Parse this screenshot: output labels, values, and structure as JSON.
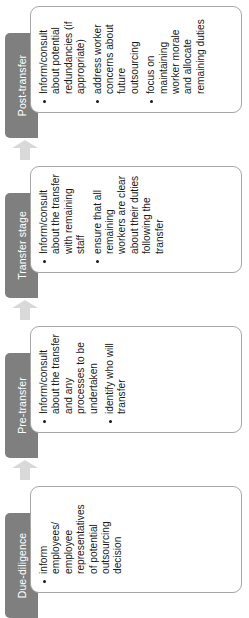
{
  "diagram": {
    "orientation": "rotated-90-ccw",
    "colors": {
      "tab_background": "#7f7f7f",
      "tab_text": "#ffffff",
      "box_background": "#ffffff",
      "box_border": "#a6a6a6",
      "arrow_fill": "#d9d9d9",
      "body_text": "#1a1a1a"
    },
    "stages": [
      {
        "label": "Due-diligence",
        "bullets": [
          "inform employees/ employee representatives of potential outsourcing decision"
        ]
      },
      {
        "label": "Pre-transfer",
        "bullets": [
          "Inform/consult about the transfer and any processes to be undertaken",
          "identify who will transfer"
        ]
      },
      {
        "label": "Transfer stage",
        "bullets": [
          "Inform/consult about the transfer with remaining staff",
          "ensure that all remaining workers are clear about their duties following the transfer"
        ]
      },
      {
        "label": "Post-transfer",
        "bullets": [
          "Inform/consult about potential redundancies (if appropriate)",
          "address worker concerns about future outsourcing",
          "focus on maintaining worker morale and allocate remaining duties"
        ]
      }
    ],
    "arrows": [
      {
        "name": "arrow-due-diligence-to-pre-transfer",
        "direction": "forward"
      },
      {
        "name": "arrow-pre-transfer-to-transfer-stage",
        "direction": "forward"
      },
      {
        "name": "arrow-transfer-stage-to-post-transfer",
        "direction": "forward"
      }
    ]
  }
}
